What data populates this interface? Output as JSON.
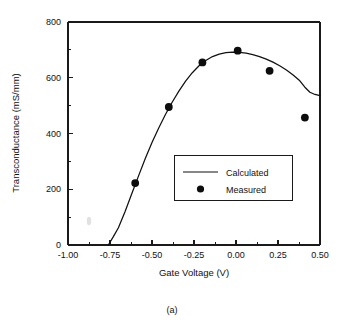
{
  "figure": {
    "caption": "(a)",
    "smudge_mark": "ink-smudge"
  },
  "chart_data": {
    "type": "scatter",
    "title": "",
    "xlabel": "Gate Voltage (V)",
    "ylabel": "Transconductance (mS/mm)",
    "xlim": [
      -1.0,
      0.5
    ],
    "ylim": [
      0,
      800
    ],
    "grid": false,
    "xticks": [
      -1.0,
      -0.75,
      -0.5,
      -0.25,
      0.0,
      0.25,
      0.5
    ],
    "xticklabels": [
      "-1.00",
      "-0.75",
      "-0.50",
      "-0.25",
      "0.00",
      "0.25",
      "0.50"
    ],
    "xtick_minor_step": 0.125,
    "yticks": [
      0,
      200,
      400,
      600,
      800
    ],
    "yticklabels": [
      "0",
      "200",
      "400",
      "600",
      "800"
    ],
    "ytick_minor_step": 100,
    "legend_position": "center-right-inside",
    "series": [
      {
        "name": "Calculated",
        "type": "line",
        "x": [
          -0.76,
          -0.73,
          -0.7,
          -0.66,
          -0.62,
          -0.58,
          -0.54,
          -0.5,
          -0.46,
          -0.42,
          -0.38,
          -0.34,
          -0.3,
          -0.26,
          -0.22,
          -0.18,
          -0.14,
          -0.1,
          -0.06,
          -0.02,
          0.02,
          0.06,
          0.1,
          0.14,
          0.18,
          0.22,
          0.26,
          0.3,
          0.34,
          0.38,
          0.41,
          0.44,
          0.47,
          0.5
        ],
        "y": [
          0,
          30,
          62,
          120,
          185,
          248,
          310,
          368,
          420,
          468,
          512,
          552,
          588,
          618,
          643,
          662,
          676,
          685,
          690,
          692,
          691,
          688,
          683,
          676,
          667,
          656,
          643,
          628,
          610,
          589,
          566,
          548,
          540,
          536
        ]
      },
      {
        "name": "Measured",
        "type": "scatter",
        "x": [
          -0.6,
          -0.4,
          -0.2,
          0.01,
          0.2,
          0.41
        ],
        "y": [
          222,
          495,
          655,
          697,
          625,
          457
        ]
      }
    ],
    "legend": [
      {
        "label": "Calculated",
        "marker": "line"
      },
      {
        "label": "Measured",
        "marker": "filled-circle"
      }
    ],
    "colors": {
      "line": "#111111",
      "marker": "#0d0d0d",
      "axis": "#1a1a1a",
      "background": "#ffffff"
    }
  }
}
